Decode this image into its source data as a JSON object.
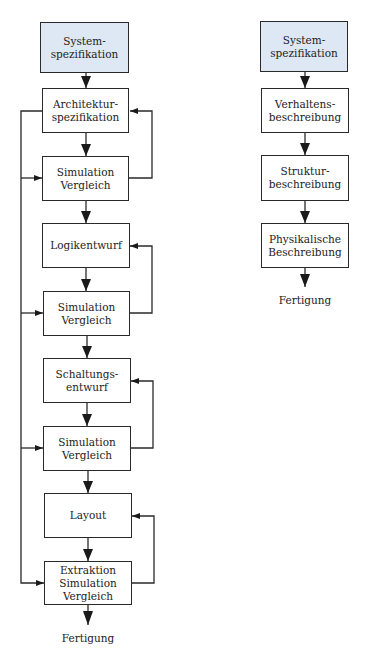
{
  "colors": {
    "spec_fill": "#dde8f4",
    "line": "#2a2a2a",
    "box_fill": "#ffffff"
  },
  "left_flow": {
    "system_spec": [
      "System-",
      "spezifikation"
    ],
    "steps": [
      {
        "lines": [
          "Architektur-",
          "spezifikation"
        ]
      },
      {
        "lines": [
          "Simulation",
          "Vergleich"
        ]
      },
      {
        "lines": [
          "Logikentwurf"
        ]
      },
      {
        "lines": [
          "Simulation",
          "Vergleich"
        ]
      },
      {
        "lines": [
          "Schaltungs-",
          "entwurf"
        ]
      },
      {
        "lines": [
          "Simulation",
          "Vergleich"
        ]
      },
      {
        "lines": [
          "Layout"
        ]
      },
      {
        "lines": [
          "Extraktion",
          "Simulation",
          "Vergleich"
        ]
      }
    ],
    "end_label": "Fertigung"
  },
  "right_flow": {
    "system_spec": [
      "System-",
      "spezifikation"
    ],
    "steps": [
      {
        "lines": [
          "Verhaltens-",
          "beschreibung"
        ]
      },
      {
        "lines": [
          "Struktur-",
          "beschreibung"
        ]
      },
      {
        "lines": [
          "Physikalische",
          "Beschreibung"
        ]
      }
    ],
    "end_label": "Fertigung"
  }
}
